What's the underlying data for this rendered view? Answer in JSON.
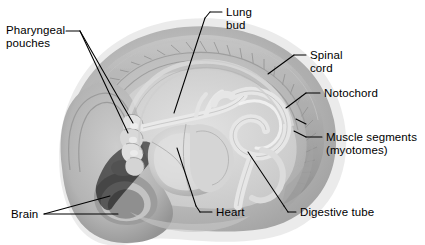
{
  "figure": {
    "background_color": "#ffffff",
    "leader_color": "#000000",
    "text_color": "#000000"
  },
  "labels": {
    "pharyngeal_pouches": "Pharyngeal\npouches",
    "lung_bud": "Lung\nbud",
    "spinal_cord": "Spinal\ncord",
    "notochord": "Notochord",
    "muscle_segments": "Muscle segments\n(myotomes)",
    "brain": "Brain",
    "heart": "Heart",
    "digestive_tube": "Digestive tube"
  },
  "structures": [
    {
      "name": "pharyngeal-pouches",
      "label": "Pharyngeal pouches"
    },
    {
      "name": "lung-bud",
      "label": "Lung bud"
    },
    {
      "name": "spinal-cord",
      "label": "Spinal cord"
    },
    {
      "name": "notochord",
      "label": "Notochord"
    },
    {
      "name": "muscle-segments",
      "label": "Muscle segments (myotomes)"
    },
    {
      "name": "brain",
      "label": "Brain"
    },
    {
      "name": "heart",
      "label": "Heart"
    },
    {
      "name": "digestive-tube",
      "label": "Digestive tube"
    }
  ],
  "palette": {
    "body_outer": "#b9b9b9",
    "body_mid": "#a3a3a3",
    "body_inner": "#c9c9c9",
    "cavity": "#d7d7d7",
    "tube_pale": "#e4e4e4",
    "tube_edge": "#9a9a9a",
    "dark_shadow": "#8a8a8a",
    "somite_line": "#9c9c9c",
    "heart_fill": "#d2d2d2",
    "brain_fill": "#9e9e9e"
  }
}
